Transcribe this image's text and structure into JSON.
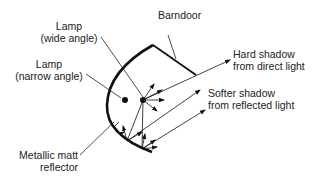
{
  "diagram": {
    "labels": {
      "barndoor": "Barndoor",
      "lamp_wide_line1": "Lamp",
      "lamp_wide_line2": "(wide angle)",
      "lamp_narrow_line1": "Lamp",
      "lamp_narrow_line2": "(narrow angle)",
      "hard_shadow_line1": "Hard shadow",
      "hard_shadow_line2": "from direct light",
      "softer_shadow_line1": "Softer shadow",
      "softer_shadow_line2": "from reflected light",
      "reflector_line1": "Metallic matt",
      "reflector_line2": "reflector"
    },
    "colors": {
      "line": "#111111",
      "text": "#222222",
      "background": "#ffffff"
    }
  }
}
